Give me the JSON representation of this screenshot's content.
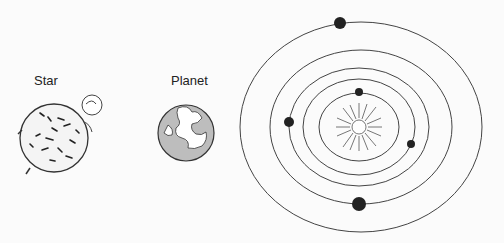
{
  "labels": {
    "star": "Star",
    "planet": "Planet"
  },
  "diagram": {
    "type": "solar-system-illustration",
    "items": [
      "Star",
      "Planet",
      "Orbit diagram"
    ],
    "orbit_count": 5,
    "planet_count": 5,
    "central_body": "sun-icon"
  }
}
